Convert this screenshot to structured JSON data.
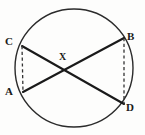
{
  "figure": {
    "background_color": "#fdfdfc",
    "stroke_color": "#1a1a1a",
    "circle_stroke_color": "#2b2b2b",
    "dash_color": "#333333"
  },
  "labels": {
    "a": "A",
    "b": "B",
    "c": "C",
    "d": "D",
    "x": "X"
  },
  "geometry": {
    "circle": {
      "cx": 74,
      "cy": 68,
      "r": 59
    },
    "points": {
      "A": {
        "x": 23,
        "y": 92
      },
      "B": {
        "x": 124,
        "y": 38
      },
      "C": {
        "x": 22,
        "y": 46
      },
      "D": {
        "x": 124,
        "y": 104
      },
      "X": {
        "x": 66,
        "y": 67
      }
    },
    "chords": [
      {
        "name": "chord-A-B",
        "from": "A",
        "to": "B"
      },
      {
        "name": "chord-C-D",
        "from": "C",
        "to": "D"
      }
    ],
    "dashed_segments": [
      {
        "name": "dashed-C-A",
        "from": "C",
        "to": "A"
      },
      {
        "name": "dashed-B-D",
        "from": "B",
        "to": "D"
      }
    ]
  },
  "label_positions": {
    "a": {
      "left": 5,
      "top": 86
    },
    "b": {
      "left": 127,
      "top": 31
    },
    "c": {
      "left": 5,
      "top": 36
    },
    "d": {
      "left": 126,
      "top": 102
    },
    "x": {
      "left": 59,
      "top": 51
    }
  }
}
